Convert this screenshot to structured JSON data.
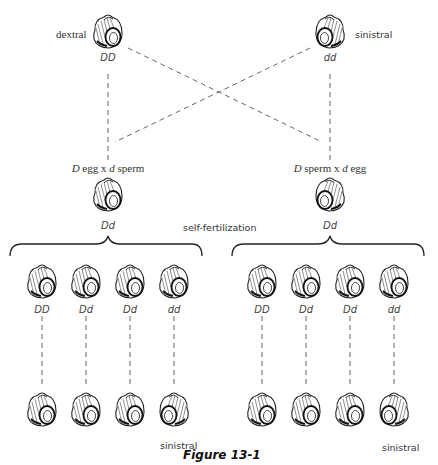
{
  "figure": {
    "caption": "Figure 13-1",
    "colors": {
      "ink": "#222222",
      "background": "#ffffff"
    }
  },
  "parents": {
    "left": {
      "phenotype": "dextral",
      "genotype": "DD",
      "coiling": "dextral"
    },
    "right": {
      "phenotype": "sinistral",
      "genotype": "dd",
      "coiling": "sinistral"
    }
  },
  "crosses": {
    "left": {
      "part1_allele": "D",
      "part1_word": "egg",
      "times": "x",
      "part2_allele": "d",
      "part2_word": "sperm"
    },
    "right": {
      "part1_allele": "D",
      "part1_word": "sperm",
      "times": "x",
      "part2_allele": "d",
      "part2_word": "egg"
    }
  },
  "f1": {
    "left": {
      "genotype": "Dd",
      "coiling": "dextral"
    },
    "right": {
      "genotype": "Dd",
      "coiling": "sinistral"
    }
  },
  "process_label": "self-fertilization",
  "f2": {
    "left": [
      {
        "genotype": "DD",
        "coiling": "dextral"
      },
      {
        "genotype": "Dd",
        "coiling": "dextral"
      },
      {
        "genotype": "Dd",
        "coiling": "dextral"
      },
      {
        "genotype": "dd",
        "coiling": "dextral"
      }
    ],
    "right": [
      {
        "genotype": "DD",
        "coiling": "dextral"
      },
      {
        "genotype": "Dd",
        "coiling": "dextral"
      },
      {
        "genotype": "Dd",
        "coiling": "dextral"
      },
      {
        "genotype": "dd",
        "coiling": "dextral"
      }
    ]
  },
  "f3": {
    "left": [
      {
        "coiling": "dextral"
      },
      {
        "coiling": "dextral"
      },
      {
        "coiling": "dextral"
      },
      {
        "coiling": "sinistral",
        "label": "sinistral"
      }
    ],
    "right": [
      {
        "coiling": "dextral"
      },
      {
        "coiling": "dextral"
      },
      {
        "coiling": "dextral"
      },
      {
        "coiling": "sinistral",
        "label": "sinistral"
      }
    ]
  }
}
